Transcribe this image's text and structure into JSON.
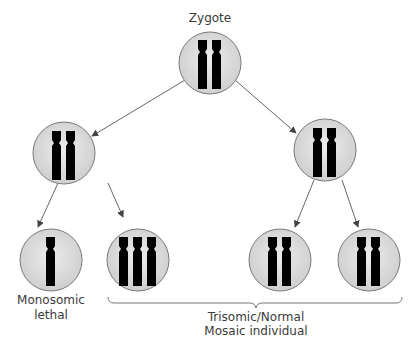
{
  "diagram": {
    "title": "Zygote",
    "nodes": [
      {
        "id": "zygote",
        "label": "Zygote",
        "chromosomes": 2
      },
      {
        "id": "left-cell",
        "chromosomes": 2
      },
      {
        "id": "right-cell",
        "chromosomes": 2
      },
      {
        "id": "left-left",
        "chromosomes": 1
      },
      {
        "id": "left-right",
        "chromosomes": 3
      },
      {
        "id": "right-left",
        "chromosomes": 2
      },
      {
        "id": "right-right",
        "chromosomes": 2
      }
    ],
    "labels": {
      "zygote": "Zygote",
      "monosomic_line1": "Monosomic",
      "monosomic_line2": "lethal",
      "mosaic_line1": "Trisomic/Normal",
      "mosaic_line2": "Mosaic individual"
    },
    "colors": {
      "cell_fill": "#d9d9d9",
      "cell_stroke": "#7a7a7a",
      "chromosome": "#000000",
      "arrow": "#444444"
    }
  }
}
